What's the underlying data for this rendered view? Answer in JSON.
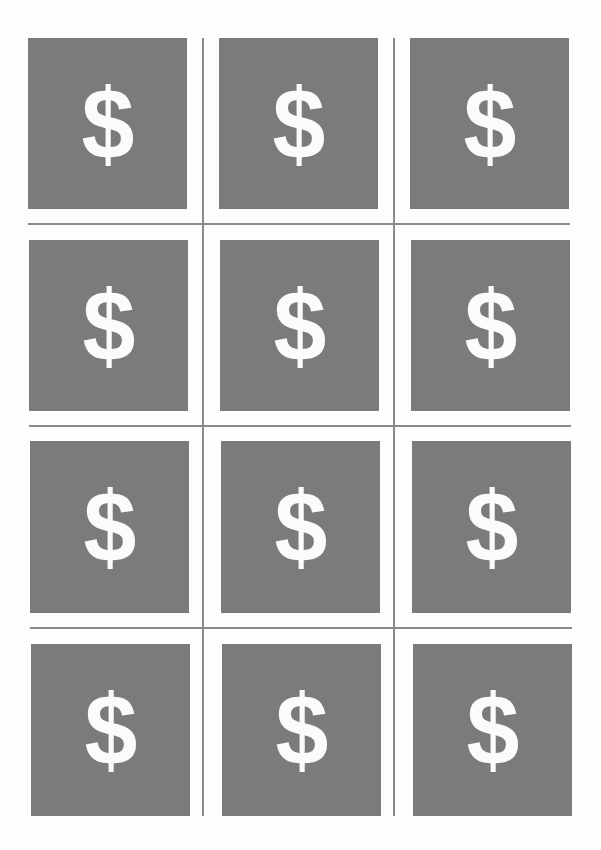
{
  "sheet": {
    "card_color": "#7b7b7b",
    "glyph_color": "#fbfbfb",
    "line_color": "#8a8a8a",
    "cards": [
      {
        "symbol": "$",
        "x": 28,
        "y": 38,
        "w": 159,
        "h": 171
      },
      {
        "symbol": "$",
        "x": 219,
        "y": 38,
        "w": 159,
        "h": 171
      },
      {
        "symbol": "$",
        "x": 410,
        "y": 38,
        "w": 159,
        "h": 171
      },
      {
        "symbol": "$",
        "x": 29,
        "y": 240,
        "w": 159,
        "h": 171
      },
      {
        "symbol": "$",
        "x": 220,
        "y": 240,
        "w": 159,
        "h": 171
      },
      {
        "symbol": "$",
        "x": 411,
        "y": 240,
        "w": 159,
        "h": 171
      },
      {
        "symbol": "$",
        "x": 30,
        "y": 441,
        "w": 159,
        "h": 172
      },
      {
        "symbol": "$",
        "x": 221,
        "y": 441,
        "w": 159,
        "h": 172
      },
      {
        "symbol": "$",
        "x": 412,
        "y": 441,
        "w": 159,
        "h": 172
      },
      {
        "symbol": "$",
        "x": 31,
        "y": 644,
        "w": 159,
        "h": 172
      },
      {
        "symbol": "$",
        "x": 222,
        "y": 644,
        "w": 159,
        "h": 172
      },
      {
        "symbol": "$",
        "x": 413,
        "y": 644,
        "w": 159,
        "h": 172
      }
    ],
    "vlines": [
      {
        "x": 202,
        "y": 38,
        "h": 778
      },
      {
        "x": 393,
        "y": 38,
        "h": 778
      }
    ],
    "hlines": [
      {
        "x": 28,
        "y": 223,
        "w": 542
      },
      {
        "x": 29,
        "y": 425,
        "w": 542
      },
      {
        "x": 30,
        "y": 627,
        "w": 542
      }
    ]
  }
}
